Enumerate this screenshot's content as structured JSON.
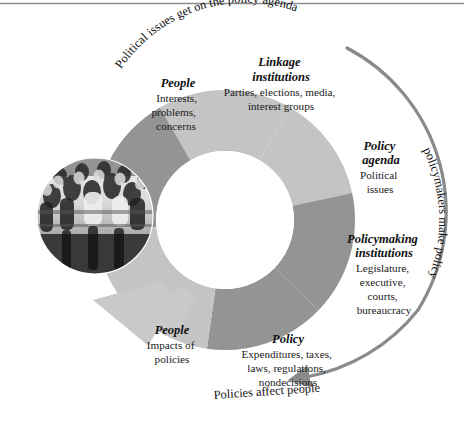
{
  "figure": {
    "type": "cycle-diagram",
    "top_rule": true
  },
  "colors": {
    "segment_dark": "#949494",
    "segment_light": "#c4c4c4",
    "arrow_big": "#c9c9c9",
    "arc_arrow": "#8a8a8a",
    "text": "#1a1a1a",
    "background": "#ffffff"
  },
  "segments": [
    {
      "id": "people-inputs",
      "title": "People",
      "body": [
        "Interests,",
        "problems,",
        "concerns"
      ],
      "shade": "dark",
      "start_angle": -96,
      "end_angle": -30
    },
    {
      "id": "linkage-institutions",
      "title": "Linkage\ninstitutions",
      "title_lines": [
        "Linkage",
        "institutions"
      ],
      "body": [
        "Parties, elections, media,",
        "interest groups"
      ],
      "shade": "light",
      "start_angle": -30,
      "end_angle": 30
    },
    {
      "id": "policy-agenda",
      "title": "Policy\nagenda",
      "title_lines": [
        "Policy",
        "agenda"
      ],
      "body": [
        "Political",
        "issues"
      ],
      "shade": "light",
      "start_angle": 30,
      "end_angle": 78
    },
    {
      "id": "policymaking-institutions",
      "title": "Policymaking\ninstitutions",
      "title_lines": [
        "Policymaking",
        "institutions"
      ],
      "body": [
        "Legislature,",
        "executive,",
        "courts,",
        "bureaucracy"
      ],
      "shade": "dark",
      "start_angle": 78,
      "end_angle": 134
    },
    {
      "id": "policy",
      "title": "Policy",
      "title_lines": [
        "Policy"
      ],
      "body": [
        "Expenditures, taxes,",
        "laws, regulations,",
        "nondecisions"
      ],
      "shade": "dark",
      "start_angle": 134,
      "end_angle": 188
    },
    {
      "id": "people-impacts",
      "title": "People",
      "title_lines": [
        "People"
      ],
      "body": [
        "Impacts of",
        "policies"
      ],
      "shade": "light",
      "start_angle": 188,
      "end_angle": 264
    }
  ],
  "arc_labels": [
    {
      "id": "top-arc-label",
      "text": "Political issues get on the policy agenda",
      "position": "top"
    },
    {
      "id": "right-arc-label",
      "text": "policymakers make policy",
      "position": "right"
    },
    {
      "id": "bottom-arc-label",
      "text": "Policies affect people",
      "position": "bottom"
    }
  ],
  "photo": {
    "id": "crowd-photo",
    "alt": "Black and white photograph of a crowd of people",
    "shape": "circle"
  }
}
